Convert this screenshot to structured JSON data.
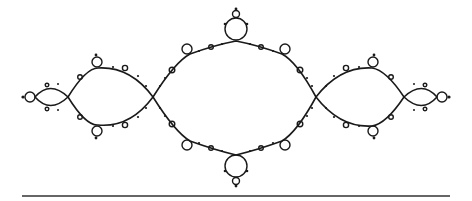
{
  "figure": {
    "colors": {
      "line": "#1a1a1a",
      "background": "#ffffff",
      "rule": "#333333"
    }
  }
}
